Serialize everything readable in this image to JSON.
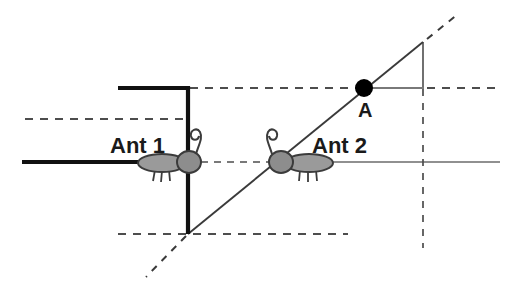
{
  "figure": {
    "width": 515,
    "height": 290,
    "background_color": "#ffffff"
  },
  "labels": {
    "ant1": "Ant 1",
    "ant2": "Ant 2",
    "point_a": "A"
  },
  "colors": {
    "ink": "#1a1a1a",
    "thin_line": "#555555",
    "dashed_line": "#4d4d4d",
    "ant_body_fill": "#9a9a9a",
    "ant_body_stroke": "#3b3b3b",
    "point_fill": "#000000"
  },
  "geometry": {
    "thick_horizontal_left": {
      "x1": 22,
      "y1": 162,
      "x2": 188,
      "y2": 162
    },
    "thick_horizontal_top": {
      "x1": 118,
      "y1": 88,
      "x2": 189,
      "y2": 88
    },
    "thick_vertical": {
      "x1": 188,
      "y1": 88,
      "x2": 188,
      "y2": 234
    },
    "dashed_horizontal_upper_left": {
      "x1": 25,
      "y1": 119,
      "x2": 188,
      "y2": 119
    },
    "dashed_horizontal_mid": {
      "x1": 188,
      "y1": 162,
      "x2": 280,
      "y2": 162
    },
    "thin_horizontal_right": {
      "x1": 300,
      "y1": 162,
      "x2": 500,
      "y2": 162
    },
    "dashed_horizontal_top_right": {
      "x1": 190,
      "y1": 88,
      "x2": 362,
      "y2": 88
    },
    "thin_horizontal_a_to_corner": {
      "x1": 366,
      "y1": 88,
      "x2": 424,
      "y2": 88
    },
    "dashed_horizontal_far_right": {
      "x1": 426,
      "y1": 88,
      "x2": 500,
      "y2": 88
    },
    "dashed_horizontal_bottom": {
      "x1": 118,
      "y1": 234,
      "x2": 348,
      "y2": 234
    },
    "diagonal_solid": {
      "x1": 188,
      "y1": 234,
      "x2": 423,
      "y2": 42
    },
    "diagonal_dashed_lower": {
      "x1": 186,
      "y1": 236,
      "x2": 146,
      "y2": 277
    },
    "diagonal_dashed_upper": {
      "x1": 426,
      "y1": 39,
      "x2": 457,
      "y2": 14
    },
    "vertical_right_solid": {
      "x1": 423,
      "y1": 42,
      "x2": 423,
      "y2": 87
    },
    "vertical_right_dashed": {
      "x1": 423,
      "y1": 89,
      "x2": 423,
      "y2": 247
    },
    "point_a": {
      "cx": 364,
      "cy": 88,
      "r": 9
    },
    "ant1": {
      "head_cx": 189,
      "head_cy": 162,
      "body_cx": 162,
      "body_cy": 163
    },
    "ant2": {
      "head_cx": 280,
      "head_cy": 162,
      "body_cx": 308,
      "body_cy": 163
    }
  }
}
